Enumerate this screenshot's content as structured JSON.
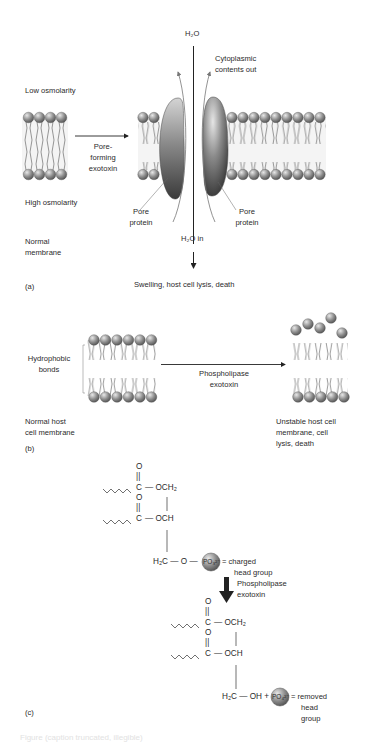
{
  "panel_a": {
    "panel_label": "(a)",
    "low_osmolarity": "Low osmolarity",
    "high_osmolarity": "High osmolarity",
    "normal_membrane": [
      "Normal",
      "membrane"
    ],
    "arrow_label": [
      "Pore-",
      "forming",
      "exotoxin"
    ],
    "h2o_top": "H₂O",
    "cytoplasmic": [
      "Cytoplasmic",
      "contents out"
    ],
    "pore_protein_left": [
      "Pore",
      "protein"
    ],
    "pore_protein_right": [
      "Pore",
      "protein"
    ],
    "h2o_in": "H₂O in",
    "outcome": "Swelling, host cell lysis, death"
  },
  "panel_b": {
    "panel_label": "(b)",
    "hydrophobic": [
      "Hydrophobic",
      "bonds"
    ],
    "arrow_label": [
      "Phospholipase",
      "exotoxin"
    ],
    "normal_host": [
      "Normal host",
      "cell membrane"
    ],
    "unstable": [
      "Unstable host cell",
      "membrane, cell",
      "lysis, death"
    ]
  },
  "panel_c": {
    "panel_label": "(c)",
    "carbonyl_o": "O",
    "double_bond": "||",
    "c_atom": "C",
    "och2": "— OCH₂",
    "och": "— OCH",
    "h2c_o": "H₂C — O —",
    "po3": "PO₃²⁻",
    "charged": [
      "= charged",
      "head group"
    ],
    "arrow_label": [
      "Phospholipase",
      "exotoxin"
    ],
    "h2c_oh": "H₂C — OH +",
    "po4": "PO₄²⁻",
    "removed": [
      "= removed",
      "head",
      "group"
    ]
  },
  "caption_fragment": "Figure (caption truncated, illegible)"
}
